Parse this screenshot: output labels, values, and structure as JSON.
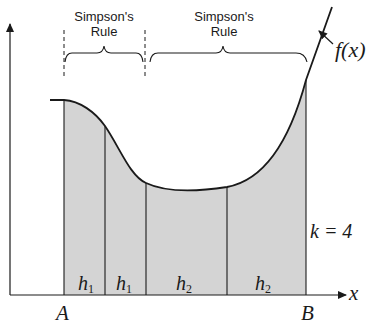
{
  "diagram": {
    "bracket_labels": [
      {
        "line1": "Simpson's",
        "line2": "Rule"
      },
      {
        "line1": "Simpson's",
        "line2": "Rule"
      }
    ],
    "function_label": "f(x)",
    "x_axis_label": "x",
    "lower_limit_label": "A",
    "upper_limit_label": "B",
    "k_label": "k = 4",
    "segments": [
      {
        "label": "h",
        "sub": "1"
      },
      {
        "label": "h",
        "sub": "1"
      },
      {
        "label": "h",
        "sub": "2"
      },
      {
        "label": "h",
        "sub": "2"
      }
    ],
    "colors": {
      "fill": "#d4d4d4",
      "stroke": "#1a1a1a",
      "background": "#ffffff"
    }
  }
}
